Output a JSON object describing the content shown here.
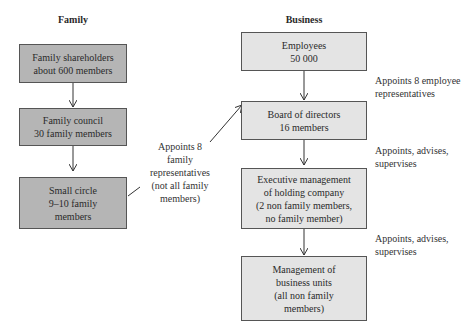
{
  "headings": {
    "family": "Family",
    "business": "Business"
  },
  "family": {
    "boxes": [
      {
        "label": "Family shareholders\nabout 600 members"
      },
      {
        "label": "Family council\n30 family members"
      },
      {
        "label": "Small circle\n9–10 family\nmembers"
      }
    ],
    "note": "Appoints 8\nfamily\nrepresentatives\n(not all family\nmembers)"
  },
  "business": {
    "boxes": [
      {
        "label": "Employees\n50 000"
      },
      {
        "label": "Board of directors\n16 members"
      },
      {
        "label": "Executive management\nof holding company\n(2 non family members,\nno family member)"
      },
      {
        "label": "Management of\nbusiness units\n(all non family\nmembers)"
      }
    ],
    "notes": [
      "Appoints 8 employee\nrepresentatives",
      "Appoints, advises,\nsupervises",
      "Appoints, advises,\nsupervises"
    ]
  },
  "colors": {
    "family_box": "#b5b5b5",
    "business_box": "#e4e4e4",
    "border": "#555555"
  }
}
